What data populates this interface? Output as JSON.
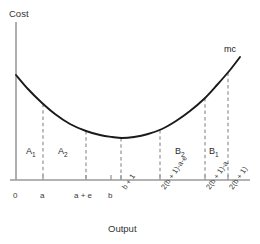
{
  "figure": {
    "type": "line-chart",
    "y_axis_title": "Cost",
    "x_axis_title": "Output",
    "curve_label": "mc",
    "axis_color": "#9a9a9a",
    "curve_color": "#1a1a1a",
    "dash_color": "#9a9a9a",
    "text_color": "#3a3a3a"
  },
  "regions": [
    {
      "id": "A1",
      "label": "A",
      "sub": "1",
      "x": 26,
      "y": 146
    },
    {
      "id": "A2",
      "label": "A",
      "sub": "2",
      "x": 58,
      "y": 146
    },
    {
      "id": "B2",
      "label": "B",
      "sub": "2",
      "x": 175,
      "y": 146
    },
    {
      "id": "B1",
      "label": "B",
      "sub": "1",
      "x": 209,
      "y": 146
    }
  ],
  "x_ticks": [
    {
      "id": "origin",
      "label": "0",
      "x": 16,
      "dashed": false,
      "rotated": false,
      "label_x": 13,
      "label_y": 191
    },
    {
      "id": "a",
      "label": "a",
      "x": 43,
      "dashed": true,
      "rotated": false,
      "label_x": 40,
      "label_y": 191
    },
    {
      "id": "a-plus-e",
      "label": "a + e",
      "x": 86,
      "dashed": true,
      "rotated": false,
      "label_x": 74,
      "label_y": 191
    },
    {
      "id": "b",
      "label": "b",
      "x": 111,
      "dashed": false,
      "rotated": false,
      "label_x": 108,
      "label_y": 191
    },
    {
      "id": "b-plus-1",
      "label": "b + 1",
      "x": 121,
      "dashed": true,
      "rotated": true,
      "label_x": 120,
      "label_y": 186
    },
    {
      "id": "2b1-a-e",
      "label": "2(b + 1)-a-e",
      "x": 160,
      "dashed": true,
      "rotated": true,
      "label_x": 159,
      "label_y": 186
    },
    {
      "id": "2b1-a",
      "label": "2(b + 1)-a",
      "x": 205,
      "dashed": true,
      "rotated": true,
      "label_x": 204,
      "label_y": 186
    },
    {
      "id": "2b1",
      "label": "2(b + 1)",
      "x": 228,
      "dashed": true,
      "rotated": true,
      "label_x": 227,
      "label_y": 186
    }
  ],
  "chart_data": {
    "type": "line",
    "title": "",
    "xlabel": "Output",
    "ylabel": "Cost",
    "grid": false,
    "legend": "none",
    "series": [
      {
        "name": "mc",
        "comment": "U-shaped marginal cost curve",
        "points": [
          [
            16,
            75
          ],
          [
            28,
            89
          ],
          [
            41,
            102
          ],
          [
            55,
            114
          ],
          [
            70,
            124
          ],
          [
            86,
            131
          ],
          [
            100,
            135
          ],
          [
            112,
            137
          ],
          [
            122,
            138
          ],
          [
            134,
            137
          ],
          [
            148,
            134
          ],
          [
            162,
            129
          ],
          [
            176,
            121
          ],
          [
            190,
            111
          ],
          [
            204,
            99
          ],
          [
            217,
            85
          ],
          [
            230,
            70
          ],
          [
            240,
            57
          ]
        ]
      }
    ],
    "x_tick_labels": [
      "0",
      "a",
      "a + e",
      "b",
      "b + 1",
      "2(b + 1)-a-e",
      "2(b + 1)-a",
      "2(b + 1)"
    ],
    "y_tick_labels": [],
    "annotations": [
      "A₁",
      "A₂",
      "B₂",
      "B₁",
      "mc"
    ]
  }
}
